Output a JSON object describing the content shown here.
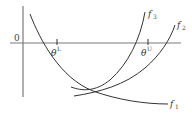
{
  "figure": {
    "origin_label": "0",
    "ticks": [
      {
        "symbol": "θ",
        "superscript": "L"
      },
      {
        "symbol": "θ",
        "superscript": "U"
      }
    ],
    "curves": [
      {
        "name": "f",
        "subscript": "1"
      },
      {
        "name": "f",
        "subscript": "2"
      },
      {
        "name": "f",
        "subscript": "3"
      }
    ],
    "colors": {
      "curve": "#333333",
      "axis": "#7a7a7a",
      "background": "#ffffff"
    }
  }
}
